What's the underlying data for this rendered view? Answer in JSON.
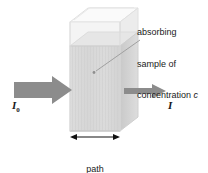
{
  "figure": {
    "background_color": "#ffffff",
    "width": 208,
    "height": 173
  },
  "callout": {
    "line1": "absorbing",
    "line2": "sample of",
    "line3_prefix": "concentration ",
    "line3_symbol": "c",
    "leader_line": {
      "from_x": 140,
      "from_y": 40,
      "to_x": 94,
      "to_y": 72
    }
  },
  "labels": {
    "incident_intensity": "I",
    "incident_intensity_subscript": "0",
    "transmitted_intensity": "I"
  },
  "dimension": {
    "line1": "path",
    "line2_prefix": "length ",
    "line2_symbol": "l"
  },
  "colors": {
    "arrow_gray": "#8c8c8c",
    "sample_fill": "#d9d9d9",
    "sample_fill_dark": "#cfcfcf",
    "empty_fill": "#f2f2f2",
    "cuvette_edge": "#e2e2e2",
    "leader_line": "#9a9a9a",
    "text": "#1a1a1a",
    "dimension_line": "#111111"
  },
  "geometry": {
    "front_face_left": 70,
    "front_face_right": 120,
    "front_face_top": 22,
    "front_face_bottom": 131,
    "depth_dx": 18,
    "depth_dy": -14,
    "liquid_level_y": 46
  }
}
